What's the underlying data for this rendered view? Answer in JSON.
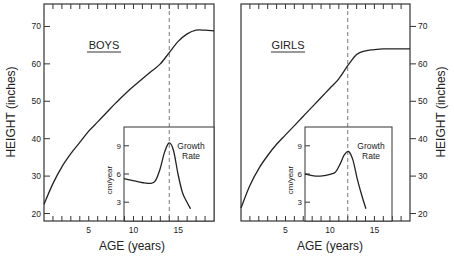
{
  "chart_data": [
    {
      "type": "line",
      "title": "BOYS",
      "xlabel": "AGE (years)",
      "ylabel": "HEIGHT (inches)",
      "xlim": [
        0,
        19
      ],
      "ylim": [
        18,
        76
      ],
      "xticks": [
        5,
        10,
        15
      ],
      "yticks": [
        20,
        30,
        40,
        50,
        60,
        70
      ],
      "marker_age": 14,
      "series": [
        {
          "name": "Height",
          "x": [
            0,
            1,
            2,
            3,
            4,
            5,
            6,
            7,
            8,
            9,
            10,
            11,
            12,
            13,
            14,
            15,
            16,
            17,
            18,
            19
          ],
          "values": [
            22.5,
            28,
            32.5,
            36,
            39,
            42,
            44.5,
            47,
            49.5,
            51.8,
            54,
            56,
            58,
            60,
            63,
            66,
            68,
            69,
            69,
            68.8
          ]
        }
      ],
      "inset": {
        "title": "Growth Rate",
        "ylabel": "cm/year",
        "xlim": [
          9,
          19
        ],
        "ylim": [
          1,
          11
        ],
        "yticks": [
          3,
          6,
          9
        ],
        "x": [
          9,
          10,
          11,
          12,
          12.5,
          13,
          13.5,
          14,
          14.5,
          15,
          15.5,
          16,
          16.4
        ],
        "values": [
          5.5,
          5.3,
          5.1,
          5.0,
          5.3,
          6.5,
          8.3,
          9.3,
          8.5,
          6.0,
          4.0,
          3.0,
          2.3
        ]
      }
    },
    {
      "type": "line",
      "title": "GIRLS",
      "xlabel": "AGE (years)",
      "ylabel": "HEIGHT (inches)",
      "xlim": [
        0,
        19
      ],
      "ylim": [
        18,
        76
      ],
      "xticks": [
        5,
        10,
        15
      ],
      "yticks": [
        20,
        30,
        40,
        50,
        60,
        70
      ],
      "marker_age": 12,
      "series": [
        {
          "name": "Height",
          "x": [
            0,
            1,
            2,
            3,
            4,
            5,
            6,
            7,
            8,
            9,
            10,
            11,
            12,
            13,
            14,
            15,
            16,
            17,
            18,
            19
          ],
          "values": [
            21.5,
            27.5,
            32,
            35.5,
            38.5,
            41,
            43.5,
            46,
            48.5,
            51,
            53.5,
            56,
            59.5,
            62.5,
            63.5,
            63.8,
            64,
            64,
            64,
            64
          ]
        }
      ],
      "inset": {
        "title": "Growth Rate",
        "ylabel": "cm/year",
        "xlim": [
          7,
          17
        ],
        "ylim": [
          1,
          11
        ],
        "yticks": [
          3,
          6,
          9
        ],
        "x": [
          7,
          8,
          9,
          10,
          10.5,
          11,
          11.5,
          12,
          12.5,
          13,
          13.5,
          14
        ],
        "values": [
          6.0,
          5.8,
          5.8,
          6.0,
          6.2,
          7.0,
          8.0,
          8.4,
          7.5,
          5.5,
          3.8,
          2.3
        ]
      }
    }
  ],
  "labels": {
    "boys_title": "BOYS",
    "girls_title": "GIRLS",
    "x_axis": "AGE (years)",
    "y_axis": "HEIGHT (inches)",
    "inset_title_line1": "Growth",
    "inset_title_line2": "Rate",
    "inset_ylabel": "cm/year"
  }
}
